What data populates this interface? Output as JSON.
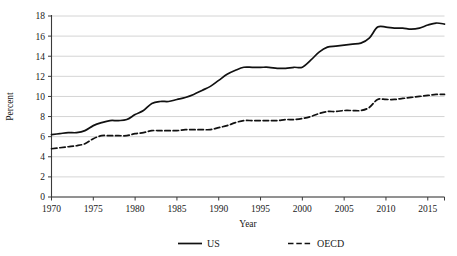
{
  "chart_data": {
    "type": "line",
    "title": "",
    "subtitle": "",
    "xlabel": "Year",
    "ylabel": "Percent",
    "xlim": [
      1970,
      2017
    ],
    "ylim": [
      0,
      18
    ],
    "grid": "horizontal",
    "legend_position": "bottom-center",
    "x_ticks": [
      1970,
      1975,
      1980,
      1985,
      1990,
      1995,
      2000,
      2005,
      2010,
      2015
    ],
    "x_tick_labels": [
      "1970",
      "1975",
      "1980",
      "1985",
      "1990",
      "1995",
      "2000",
      "2005",
      "2010",
      "2015"
    ],
    "y_ticks": [
      0,
      2,
      4,
      6,
      8,
      10,
      12,
      14,
      16,
      18
    ],
    "y_tick_labels": [
      "0",
      "2",
      "4",
      "6",
      "8",
      "10",
      "12",
      "14",
      "16",
      "18"
    ],
    "x": [
      1970,
      1971,
      1972,
      1973,
      1974,
      1975,
      1976,
      1977,
      1978,
      1979,
      1980,
      1981,
      1982,
      1983,
      1984,
      1985,
      1986,
      1987,
      1988,
      1989,
      1990,
      1991,
      1992,
      1993,
      1994,
      1995,
      1996,
      1997,
      1998,
      1999,
      2000,
      2001,
      2002,
      2003,
      2004,
      2005,
      2006,
      2007,
      2008,
      2009,
      2010,
      2011,
      2012,
      2013,
      2014,
      2015,
      2016,
      2017
    ],
    "series": [
      {
        "name": "US",
        "style": "solid",
        "color": "#111111",
        "values": [
          6.2,
          6.3,
          6.4,
          6.4,
          6.6,
          7.1,
          7.4,
          7.6,
          7.6,
          7.7,
          8.2,
          8.6,
          9.3,
          9.5,
          9.5,
          9.7,
          9.9,
          10.2,
          10.6,
          11.0,
          11.6,
          12.2,
          12.6,
          12.9,
          12.9,
          12.9,
          12.9,
          12.8,
          12.8,
          12.9,
          12.9,
          13.6,
          14.4,
          14.9,
          15.0,
          15.1,
          15.2,
          15.3,
          15.8,
          16.9,
          16.9,
          16.8,
          16.8,
          16.7,
          16.8,
          17.1,
          17.3,
          17.2
        ]
      },
      {
        "name": "OECD",
        "style": "dashed",
        "color": "#111111",
        "values": [
          4.8,
          4.9,
          5.0,
          5.1,
          5.3,
          5.8,
          6.1,
          6.1,
          6.1,
          6.1,
          6.3,
          6.4,
          6.6,
          6.6,
          6.6,
          6.6,
          6.7,
          6.7,
          6.7,
          6.7,
          6.9,
          7.1,
          7.4,
          7.6,
          7.6,
          7.6,
          7.6,
          7.6,
          7.7,
          7.7,
          7.8,
          8.0,
          8.3,
          8.5,
          8.5,
          8.6,
          8.6,
          8.6,
          8.9,
          9.7,
          9.7,
          9.7,
          9.8,
          9.9,
          10.0,
          10.1,
          10.2,
          10.2
        ]
      }
    ],
    "legend": [
      {
        "label": "US",
        "style": "solid"
      },
      {
        "label": "OECD",
        "style": "dashed"
      }
    ]
  },
  "axes": {
    "y_title": "Percent",
    "x_title": "Year"
  }
}
